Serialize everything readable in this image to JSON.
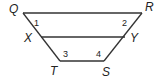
{
  "diagram": {
    "type": "trapezoid with midsegment",
    "vertices": {
      "Q": "Q",
      "R": "R",
      "X": "X",
      "Y": "Y",
      "T": "T",
      "S": "S"
    },
    "angles": {
      "a1": "1",
      "a2": "2",
      "a3": "3",
      "a4": "4"
    },
    "segments": [
      "QR",
      "XY",
      "TS",
      "QT",
      "RS"
    ],
    "colors": {
      "stroke": "#333333",
      "text": "#222222",
      "background": "#ffffff"
    }
  }
}
